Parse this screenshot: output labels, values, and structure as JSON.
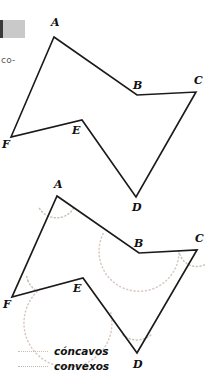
{
  "page": {
    "width": 210,
    "height": 376,
    "background": "#ffffff",
    "cut_off_text": "co-",
    "edge_block_color": "#c9c9c9"
  },
  "colors": {
    "stroke": "#1a1a1a",
    "concavos_dots": "#d8c8c0",
    "convexos_dots": "#c9c4b8",
    "label_text": "#111111",
    "body_text": "#58585a"
  },
  "figures": [
    {
      "id": "polygon-plain",
      "caption": "",
      "vertices": [
        {
          "label": "A",
          "x": 54,
          "y": 37,
          "lx": 51,
          "ly": 26,
          "kind": "convexo"
        },
        {
          "label": "B",
          "x": 137,
          "y": 95,
          "lx": 133,
          "ly": 89,
          "kind": "concavo"
        },
        {
          "label": "C",
          "x": 196,
          "y": 92,
          "lx": 194,
          "ly": 84,
          "kind": "convexo"
        },
        {
          "label": "D",
          "x": 136,
          "y": 197,
          "lx": 132,
          "ly": 211,
          "kind": "convexo"
        },
        {
          "label": "E",
          "x": 82,
          "y": 120,
          "lx": 72,
          "ly": 134,
          "kind": "concavo"
        },
        {
          "label": "F",
          "x": 11,
          "y": 137,
          "lx": 2,
          "ly": 148,
          "kind": "convexo"
        }
      ],
      "arcs": []
    },
    {
      "id": "polygon-annotated",
      "caption": "",
      "vertices": [
        {
          "label": "A",
          "x": 57,
          "y": 196,
          "lx": 54,
          "ly": 188,
          "kind": "convexo"
        },
        {
          "label": "B",
          "x": 139,
          "y": 253,
          "lx": 134,
          "ly": 247,
          "kind": "concavo"
        },
        {
          "label": "C",
          "x": 197,
          "y": 250,
          "lx": 195,
          "ly": 242,
          "kind": "convexo"
        },
        {
          "label": "D",
          "x": 137,
          "y": 353,
          "lx": 133,
          "ly": 368,
          "kind": "convexo"
        },
        {
          "label": "E",
          "x": 83,
          "y": 278,
          "lx": 73,
          "ly": 292,
          "kind": "concavo"
        },
        {
          "label": "F",
          "x": 12,
          "y": 297,
          "lx": 3,
          "ly": 308,
          "kind": "convexo"
        }
      ],
      "arcs": [
        {
          "at": "A",
          "kind": "convexo",
          "radius": 20
        },
        {
          "at": "B",
          "kind": "concavo",
          "radius": 40
        },
        {
          "at": "C",
          "kind": "convexo",
          "radius": 18
        },
        {
          "at": "D",
          "kind": "convexo",
          "radius": 22
        },
        {
          "at": "E",
          "kind": "concavo",
          "radius": 44
        },
        {
          "at": "F",
          "kind": "convexo",
          "radius": 24
        }
      ]
    }
  ],
  "legend": {
    "items": [
      {
        "label": "cóncavos",
        "style": "dotted",
        "color": "#d8c8c0"
      },
      {
        "label": "convexos",
        "style": "dotted",
        "color": "#c9c4b8"
      }
    ]
  }
}
